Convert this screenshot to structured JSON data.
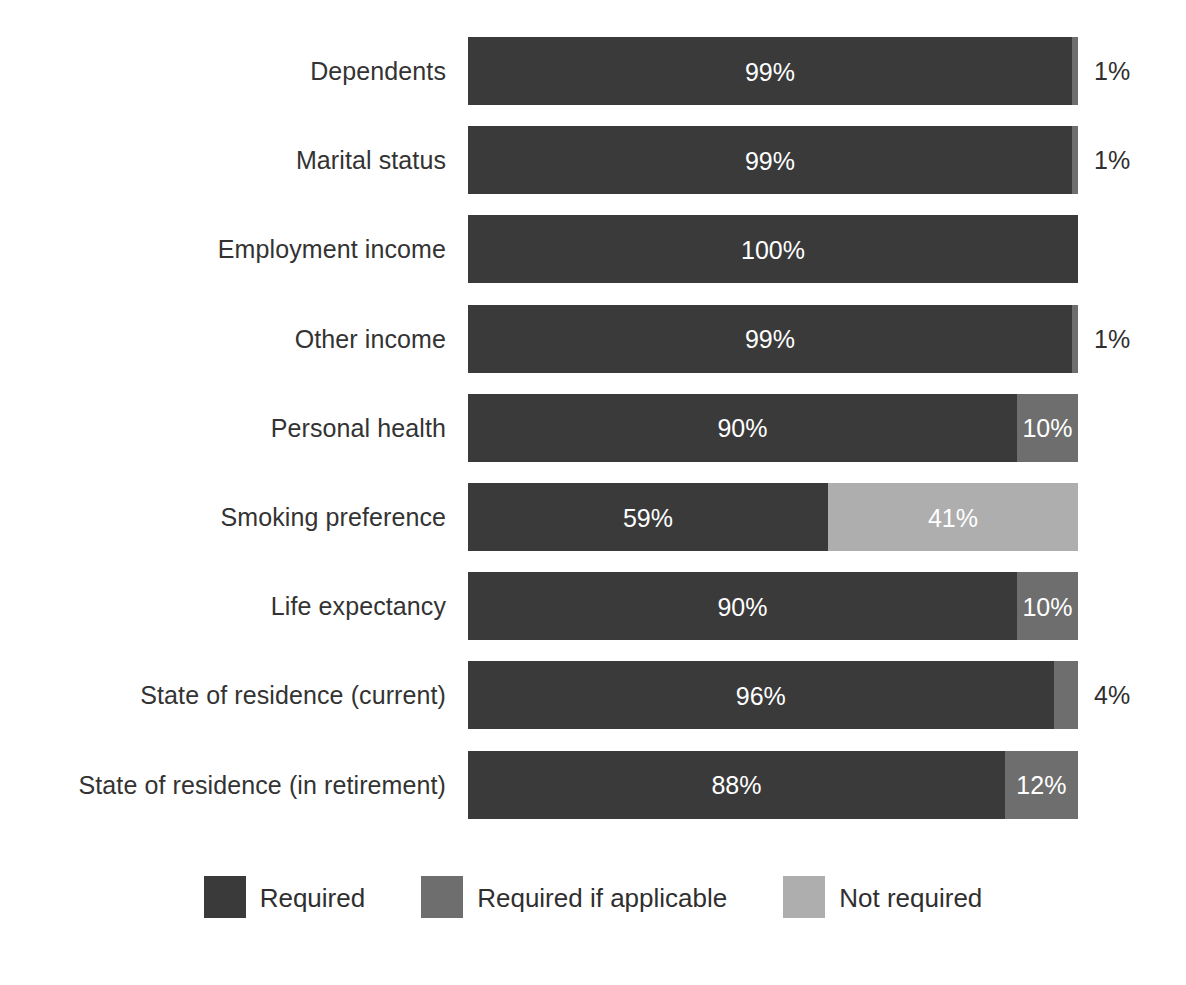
{
  "chart_data": {
    "type": "bar",
    "subtype": "stacked-horizontal-100",
    "title": "",
    "subtitle": "",
    "xlabel": "",
    "ylabel": "",
    "xlim": [
      0,
      100
    ],
    "grid": false,
    "legend_position": "bottom-center",
    "categories": [
      "Dependents",
      "Marital status",
      "Employment income",
      "Other income",
      "Personal health",
      "Smoking preference",
      "Life expectancy",
      "State of residence (current)",
      "State of residence (in retirement)"
    ],
    "series": [
      {
        "name": "Required",
        "color": "#3a3a3a",
        "values": [
          99,
          99,
          100,
          99,
          90,
          59,
          90,
          96,
          88
        ]
      },
      {
        "name": "Required if applicable",
        "color": "#6e6e6e",
        "values": [
          1,
          1,
          0,
          1,
          10,
          0,
          10,
          4,
          12
        ]
      },
      {
        "name": "Not required",
        "color": "#aeaeae",
        "values": [
          0,
          0,
          0,
          0,
          0,
          41,
          0,
          0,
          0
        ]
      }
    ],
    "rows": [
      {
        "label": "Dependents",
        "segments": [
          {
            "series": "Required",
            "value": 99,
            "label": "99%",
            "color_key": "required",
            "label_placement": "inside"
          },
          {
            "series": "Required if applicable",
            "value": 1,
            "label": "1%",
            "color_key": "required-if-applicable",
            "label_placement": "outside"
          }
        ]
      },
      {
        "label": "Marital status",
        "segments": [
          {
            "series": "Required",
            "value": 99,
            "label": "99%",
            "color_key": "required",
            "label_placement": "inside"
          },
          {
            "series": "Required if applicable",
            "value": 1,
            "label": "1%",
            "color_key": "required-if-applicable",
            "label_placement": "outside"
          }
        ]
      },
      {
        "label": "Employment income",
        "segments": [
          {
            "series": "Required",
            "value": 100,
            "label": "100%",
            "color_key": "required",
            "label_placement": "inside"
          }
        ]
      },
      {
        "label": "Other income",
        "segments": [
          {
            "series": "Required",
            "value": 99,
            "label": "99%",
            "color_key": "required",
            "label_placement": "inside"
          },
          {
            "series": "Required if applicable",
            "value": 1,
            "label": "1%",
            "color_key": "required-if-applicable",
            "label_placement": "outside"
          }
        ]
      },
      {
        "label": "Personal health",
        "segments": [
          {
            "series": "Required",
            "value": 90,
            "label": "90%",
            "color_key": "required",
            "label_placement": "inside"
          },
          {
            "series": "Required if applicable",
            "value": 10,
            "label": "10%",
            "color_key": "required-if-applicable",
            "label_placement": "inside"
          }
        ]
      },
      {
        "label": "Smoking preference",
        "segments": [
          {
            "series": "Required",
            "value": 59,
            "label": "59%",
            "color_key": "required",
            "label_placement": "inside"
          },
          {
            "series": "Not required",
            "value": 41,
            "label": "41%",
            "color_key": "not-required",
            "label_placement": "inside"
          }
        ]
      },
      {
        "label": "Life expectancy",
        "segments": [
          {
            "series": "Required",
            "value": 90,
            "label": "90%",
            "color_key": "required",
            "label_placement": "inside"
          },
          {
            "series": "Required if applicable",
            "value": 10,
            "label": "10%",
            "color_key": "required-if-applicable",
            "label_placement": "inside"
          }
        ]
      },
      {
        "label": "State of residence (current)",
        "segments": [
          {
            "series": "Required",
            "value": 96,
            "label": "96%",
            "color_key": "required",
            "label_placement": "inside"
          },
          {
            "series": "Required if applicable",
            "value": 4,
            "label": "4%",
            "color_key": "required-if-applicable",
            "label_placement": "outside"
          }
        ]
      },
      {
        "label": "State of residence (in retirement)",
        "segments": [
          {
            "series": "Required",
            "value": 88,
            "label": "88%",
            "color_key": "required",
            "label_placement": "inside"
          },
          {
            "series": "Required if applicable",
            "value": 12,
            "label": "12%",
            "color_key": "required-if-applicable",
            "label_placement": "inside"
          }
        ]
      }
    ],
    "legend": [
      {
        "label": "Required",
        "color": "#3a3a3a",
        "color_key": "required"
      },
      {
        "label": "Required if applicable",
        "color": "#6e6e6e",
        "color_key": "required-if-applicable"
      },
      {
        "label": "Not required",
        "color": "#aeaeae",
        "color_key": "not-required"
      }
    ]
  }
}
